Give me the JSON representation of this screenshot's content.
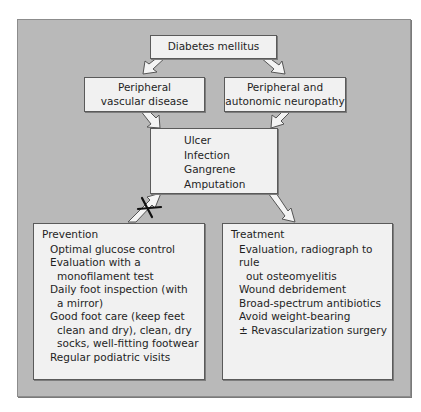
{
  "diagram": {
    "root": {
      "label": "Diabetes mellitus"
    },
    "causes": [
      {
        "lines": [
          "Peripheral",
          "vascular disease"
        ]
      },
      {
        "lines": [
          "Peripheral and",
          "autonomic neuropathy"
        ]
      }
    ],
    "outcomes": {
      "items": [
        "Ulcer",
        "Infection",
        "Gangrene",
        "Amputation"
      ]
    },
    "prevention": {
      "title": "Prevention",
      "items": [
        {
          "lines": [
            "Optimal glucose control"
          ]
        },
        {
          "lines": [
            "Evaluation with a",
            "monofilament test"
          ]
        },
        {
          "lines": [
            "Daily foot inspection (with",
            "a mirror)"
          ]
        },
        {
          "lines": [
            "Good foot care (keep feet",
            "clean and dry),  clean, dry",
            "socks, well-fitting footwear"
          ]
        },
        {
          "lines": [
            "Regular podiatric visits"
          ]
        }
      ]
    },
    "treatment": {
      "title": "Treatment",
      "items": [
        {
          "lines": [
            "Evaluation, radiograph to rule",
            "out osteomyelitis"
          ]
        },
        {
          "lines": [
            "Wound debridement"
          ]
        },
        {
          "lines": [
            "Broad-spectrum antibiotics"
          ]
        },
        {
          "lines": [
            "Avoid weight-bearing"
          ]
        },
        {
          "lines": [
            "± Revascularization surgery"
          ]
        }
      ]
    },
    "blocked_arrow_marker": "X",
    "colors": {
      "panel": "#b9b9b9",
      "box": "#f1f1f1",
      "border": "#5a5a5a",
      "arrow_fill": "#f4f4f4",
      "text": "#1f1f1f"
    }
  }
}
